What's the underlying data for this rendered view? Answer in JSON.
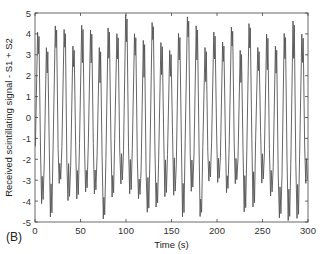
{
  "panel_label": "(B)",
  "chart_data": {
    "type": "line",
    "title": "",
    "xlabel": "Time (s)",
    "ylabel": "Received scintillating signal - S1 + S2",
    "xlim": [
      0,
      300
    ],
    "ylim": [
      -5,
      5
    ],
    "xticks": [
      0,
      50,
      100,
      150,
      200,
      250,
      300
    ],
    "yticks": [
      5,
      4,
      3,
      2,
      1,
      0,
      -1,
      -2,
      -3,
      -4,
      -5
    ],
    "grid": false,
    "legend": null,
    "series": [
      {
        "name": "S1 + S2",
        "description": "Dense oscillating signal between about -5 and +5, roughly 30 oscillation cycles over 300 s, with many peaks near +4 to +5 and troughs near -4 to -5",
        "approx_period_s": 10,
        "amplitude_range": [
          -5,
          5
        ],
        "sample_peaks": [
          {
            "t": 3,
            "y": 4.8
          },
          {
            "t": 9,
            "y": 4.7
          },
          {
            "t": 14,
            "y": 4.4
          },
          {
            "t": 22,
            "y": 4.9
          },
          {
            "t": 33,
            "y": 3.8
          },
          {
            "t": 40,
            "y": 4.6
          },
          {
            "t": 48,
            "y": 4.0
          },
          {
            "t": 60,
            "y": 3.6
          },
          {
            "t": 72,
            "y": 4.5
          },
          {
            "t": 82,
            "y": 4.6
          },
          {
            "t": 95,
            "y": 4.2
          },
          {
            "t": 110,
            "y": 4.5
          },
          {
            "t": 125,
            "y": 4.4
          },
          {
            "t": 140,
            "y": 4.6
          },
          {
            "t": 155,
            "y": 4.0
          },
          {
            "t": 170,
            "y": 4.2
          },
          {
            "t": 185,
            "y": 4.4
          },
          {
            "t": 200,
            "y": 4.3
          },
          {
            "t": 215,
            "y": 4.5
          },
          {
            "t": 230,
            "y": 4.1
          },
          {
            "t": 245,
            "y": 4.6
          },
          {
            "t": 260,
            "y": 4.3
          },
          {
            "t": 275,
            "y": 4.7
          },
          {
            "t": 290,
            "y": 4.6
          }
        ],
        "sample_troughs": [
          {
            "t": 6,
            "y": -4.5
          },
          {
            "t": 17,
            "y": -4.4
          },
          {
            "t": 25,
            "y": -5.0
          },
          {
            "t": 36,
            "y": -4.8
          },
          {
            "t": 52,
            "y": -4.2
          },
          {
            "t": 75,
            "y": -5.0
          },
          {
            "t": 88,
            "y": -4.6
          },
          {
            "t": 118,
            "y": -4.8
          },
          {
            "t": 148,
            "y": -4.7
          },
          {
            "t": 175,
            "y": -4.6
          },
          {
            "t": 205,
            "y": -4.8
          },
          {
            "t": 248,
            "y": -5.0
          },
          {
            "t": 272,
            "y": -4.9
          },
          {
            "t": 296,
            "y": -4.7
          }
        ]
      }
    ]
  },
  "render": {
    "plot_left": 35,
    "plot_top": 13,
    "plot_right": 308,
    "plot_bottom": 222,
    "line_color": "#555555",
    "axis_color": "#444444",
    "cycles": 31,
    "seed": 7
  }
}
